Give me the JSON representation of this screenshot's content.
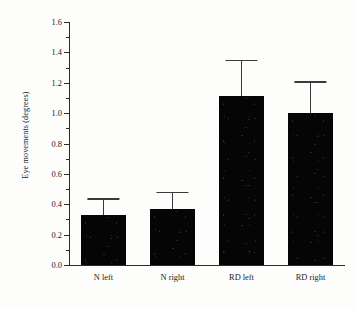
{
  "chart_data": {
    "type": "bar",
    "title": "",
    "subtitle": "",
    "xlabel": "",
    "ylabel": "Eye movements (degrees)",
    "categories": [
      "N left",
      "N right",
      "RD left",
      "RD right"
    ],
    "values": [
      0.33,
      0.37,
      1.11,
      1.0
    ],
    "errors_upper": [
      0.11,
      0.11,
      0.24,
      0.21
    ],
    "error_bar_tops": [
      0.44,
      0.48,
      1.35,
      1.21
    ],
    "error_bar_style": "upper-only",
    "ylim": [
      0.0,
      1.6
    ],
    "ytick_major_step": 0.2,
    "ytick_minor_step": 0.1,
    "ytick_labels": [
      "0.0",
      "0.2",
      "0.4",
      "0.6",
      "0.8",
      "1.0",
      "1.2",
      "1.4",
      "1.6"
    ],
    "ytick_values": [
      0.0,
      0.2,
      0.4,
      0.6,
      0.8,
      1.0,
      1.2,
      1.4,
      1.6
    ],
    "yminor_values": [
      0.1,
      0.3,
      0.5,
      0.7,
      0.9,
      1.1,
      1.3,
      1.5
    ],
    "grid": false,
    "legend": null,
    "legend_position": "none",
    "bar_color": "#050505",
    "error_color": "#3a3a3a",
    "axis_color": "#2b2b2b",
    "series": [
      {
        "name": "Eye movements",
        "values": [
          0.33,
          0.37,
          1.11,
          1.0
        ],
        "errors_upper": [
          0.11,
          0.11,
          0.24,
          0.21
        ]
      }
    ]
  }
}
